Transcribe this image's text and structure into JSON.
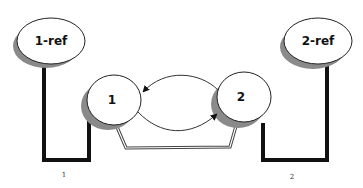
{
  "diagram": {
    "type": "state-diagram",
    "colors": {
      "background": "#ffffff",
      "stroke": "#222222",
      "shadow": "#8a8a8a",
      "bracket": "#111111",
      "fill": "#ffffff"
    },
    "nodes": [
      {
        "id": "ref1",
        "label": "1-ref",
        "shape": "ellipse"
      },
      {
        "id": "ref2",
        "label": "2-ref",
        "shape": "ellipse"
      },
      {
        "id": "n1",
        "label": "1",
        "shape": "ellipse"
      },
      {
        "id": "n2",
        "label": "2",
        "shape": "ellipse"
      }
    ],
    "edges": [
      {
        "from": "n2",
        "to": "n1",
        "style": "curved-arrow-top"
      },
      {
        "from": "n1",
        "to": "n2",
        "style": "curved-arrow-bottom"
      },
      {
        "from": "n1",
        "to": "n2",
        "style": "double-line-connector"
      },
      {
        "from": "ref1",
        "to": "n1",
        "style": "thick-bracket"
      },
      {
        "from": "ref2",
        "to": "n2",
        "style": "thick-bracket"
      }
    ],
    "captions": [
      {
        "id": "cap1",
        "text": "1"
      },
      {
        "id": "cap2",
        "text": "2"
      }
    ]
  }
}
